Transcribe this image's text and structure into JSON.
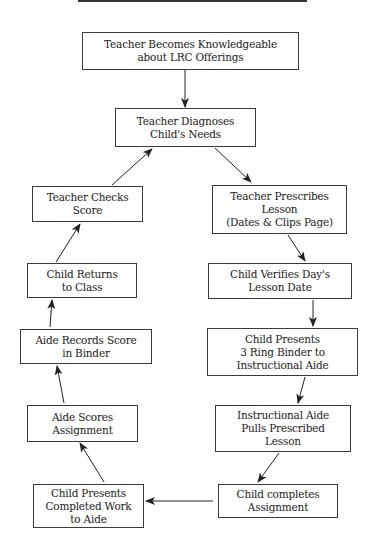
{
  "diagram": {
    "nodes": [
      {
        "id": "n1",
        "label": "Teacher Becomes Knowledgeable\nabout LRC Offerings",
        "x": 82,
        "y": 32,
        "w": 217,
        "h": 38
      },
      {
        "id": "n2",
        "label": "Teacher Diagnoses\nChild's Needs",
        "x": 115,
        "y": 108,
        "w": 141,
        "h": 39
      },
      {
        "id": "n3",
        "label": "Teacher Checks\nScore",
        "x": 32,
        "y": 186,
        "w": 111,
        "h": 36
      },
      {
        "id": "n4",
        "label": "Teacher Prescribes\nLesson\n(Dates & Clips Page)",
        "x": 212,
        "y": 185,
        "w": 135,
        "h": 49
      },
      {
        "id": "n5",
        "label": "Child Returns\nto Class",
        "x": 27,
        "y": 263,
        "w": 110,
        "h": 35
      },
      {
        "id": "n6",
        "label": "Child Verifies Day's\nLesson Date",
        "x": 208,
        "y": 263,
        "w": 144,
        "h": 36
      },
      {
        "id": "n7",
        "label": "Aide Records Score\nin Binder",
        "x": 20,
        "y": 329,
        "w": 132,
        "h": 35
      },
      {
        "id": "n8",
        "label": "Child Presents\n3 Ring Binder to\nInstructional Aide",
        "x": 207,
        "y": 328,
        "w": 151,
        "h": 48
      },
      {
        "id": "n9",
        "label": "Aide Scores\nAssignment",
        "x": 27,
        "y": 405,
        "w": 111,
        "h": 37
      },
      {
        "id": "n10",
        "label": "Instructional Aide\nPulls Prescribed\nLesson",
        "x": 215,
        "y": 405,
        "w": 136,
        "h": 47
      },
      {
        "id": "n11",
        "label": "Child completes\nAssignment",
        "x": 218,
        "y": 484,
        "w": 120,
        "h": 34
      },
      {
        "id": "n12",
        "label": "Child Presents\nCompleted Work\nto Aide",
        "x": 33,
        "y": 484,
        "w": 111,
        "h": 44
      }
    ],
    "edges": [
      {
        "from": "n1",
        "to": "n2",
        "x1": 185,
        "y1": 70,
        "x2": 185,
        "y2": 107
      },
      {
        "from": "n2",
        "to": "n4",
        "x1": 215,
        "y1": 148,
        "x2": 251,
        "y2": 182
      },
      {
        "from": "n4",
        "to": "n6",
        "x1": 288,
        "y1": 235,
        "x2": 305,
        "y2": 261
      },
      {
        "from": "n6",
        "to": "n8",
        "x1": 313,
        "y1": 300,
        "x2": 313,
        "y2": 326
      },
      {
        "from": "n8",
        "to": "n10",
        "x1": 305,
        "y1": 377,
        "x2": 298,
        "y2": 403
      },
      {
        "from": "n10",
        "to": "n11",
        "x1": 279,
        "y1": 453,
        "x2": 258,
        "y2": 482
      },
      {
        "from": "n11",
        "to": "n12",
        "x1": 213,
        "y1": 501,
        "x2": 146,
        "y2": 501
      },
      {
        "from": "n12",
        "to": "n9",
        "x1": 104,
        "y1": 482,
        "x2": 80,
        "y2": 443
      },
      {
        "from": "n9",
        "to": "n7",
        "x1": 64,
        "y1": 403,
        "x2": 57,
        "y2": 366
      },
      {
        "from": "n7",
        "to": "n5",
        "x1": 50,
        "y1": 327,
        "x2": 52,
        "y2": 300
      },
      {
        "from": "n5",
        "to": "n3",
        "x1": 56,
        "y1": 262,
        "x2": 80,
        "y2": 224
      },
      {
        "from": "n3",
        "to": "n2",
        "x1": 112,
        "y1": 185,
        "x2": 152,
        "y2": 149
      }
    ]
  }
}
